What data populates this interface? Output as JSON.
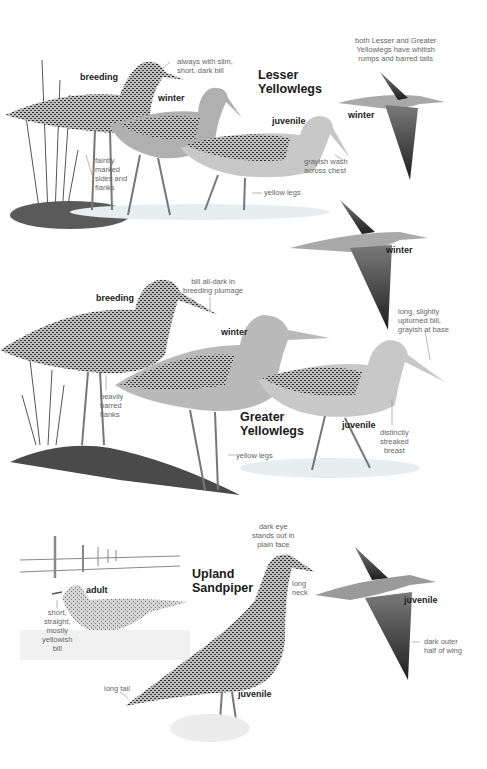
{
  "species": [
    {
      "name": "Lesser Yellowlegs",
      "title_lines": "Lesser\nYellowlegs",
      "plumages": [
        "breeding",
        "winter",
        "juvenile",
        "winter (flight)",
        "winter (flight)"
      ],
      "plumage_labels": {
        "breeding": "breeding",
        "winter": "winter",
        "juvenile": "juvenile",
        "flight_winter_1": "winter",
        "flight_winter_2": "winter"
      },
      "annotations": {
        "bill": "always with slim,\nshort, dark bill",
        "sides": "faintly\nmarked\nsides and\nflanks",
        "chest": "grayish wash\nacross chest",
        "legs": "yellow legs",
        "rump_note": "both Lesser and Greater\nYellowlegs have whitish\nrumps and barred tails"
      }
    },
    {
      "name": "Greater Yellowlegs",
      "title_lines": "Greater\nYellowlegs",
      "plumage_labels": {
        "breeding": "breeding",
        "winter": "winter",
        "juvenile": "juvenile"
      },
      "annotations": {
        "bill_breeding": "bill all-dark in\nbreeding plumage",
        "bill": "long, slightly\nupturned bill,\ngrayish at base",
        "flanks": "heavily\nbarred\nflanks",
        "legs": "yellow legs",
        "breast": "distinctly\nstreaked\nbreast"
      }
    },
    {
      "name": "Upland Sandpiper",
      "title_lines": "Upland\nSandpiper",
      "plumage_labels": {
        "adult": "adult",
        "juvenile": "juvenile",
        "flight_juvenile": "juvenile"
      },
      "annotations": {
        "eye": "dark eye\nstands out in\nplain face",
        "neck": "long\nneck",
        "bill": "short,\nstraight,\nmostly\nyellowish\nbill",
        "tail": "long tail",
        "wing": "dark outer\nhalf of wing"
      }
    }
  ],
  "colors": {
    "background": "#ffffff",
    "label_text": "#666666",
    "title_text": "#1a1a1a",
    "bird_dark": "#3a3a3a",
    "bird_mid": "#8a8a8a",
    "bird_light": "#e6e6e6"
  }
}
